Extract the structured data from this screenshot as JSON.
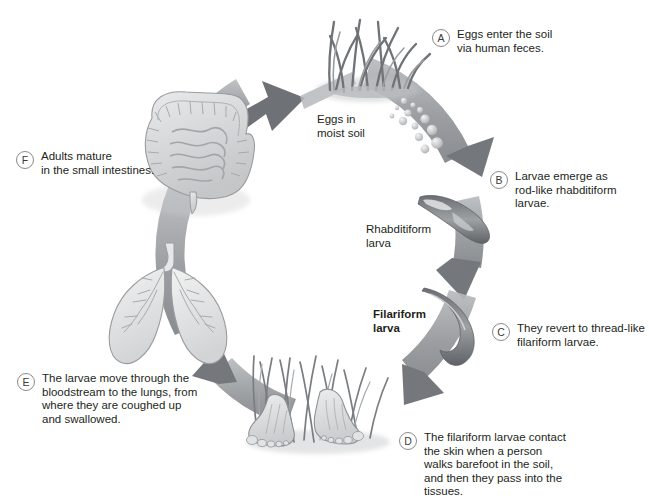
{
  "diagram": {
    "background": "#ffffff",
    "ink": "#231f20",
    "arrow_ring_color": "#8d9094",
    "arrow_head_color": "#6e7276",
    "organ_fill": "#d8d9da",
    "organ_line": "#9a9c9f"
  },
  "callouts": [
    {
      "id": "A",
      "badge": "A",
      "text": "Eggs enter the soil\nvia human feces."
    },
    {
      "id": "B",
      "badge": "B",
      "text": "Larvae emerge as\nrod-like rhabditiform\nlarvae."
    },
    {
      "id": "C",
      "badge": "C",
      "text": "They revert to thread-like\nfilariform larvae."
    },
    {
      "id": "D",
      "badge": "D",
      "text": "The filariform larvae contact\nthe skin when a person\nwalks barefoot in the soil,\nand then they pass into the\ntissues."
    },
    {
      "id": "E",
      "badge": "E",
      "text": "The larvae move through the\nbloodstream to the lungs, from\nwhere they are coughed up\nand swallowed."
    },
    {
      "id": "F",
      "badge": "F",
      "text": "Adults mature\nin the small intestines."
    }
  ],
  "inner_labels": [
    {
      "id": "eggs",
      "text": "Eggs in\nmoist soil"
    },
    {
      "id": "rhabditiform",
      "text": "Rhabditiform\nlarva"
    },
    {
      "id": "filariform",
      "text": "Filariform\nlarva"
    }
  ],
  "illustrations": [
    {
      "id": "grass-eggs",
      "name": "grass-tuft-with-eggs"
    },
    {
      "id": "rhabditiform-larva",
      "name": "rhabditiform-larva"
    },
    {
      "id": "filariform-larva",
      "name": "filariform-larva"
    },
    {
      "id": "bare-feet",
      "name": "bare-feet-in-grass"
    },
    {
      "id": "lungs",
      "name": "lungs"
    },
    {
      "id": "intestines",
      "name": "intestines"
    }
  ]
}
